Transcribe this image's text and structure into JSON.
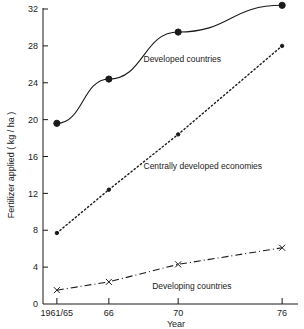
{
  "chart_data": {
    "type": "line",
    "title": "",
    "xlabel": "Year",
    "ylabel": "Fertilizer applied ( kg / ha )",
    "categories": [
      "1961/65",
      "66",
      "70",
      "76"
    ],
    "x": [
      1963,
      1966,
      1970,
      1976
    ],
    "xlim": [
      1962.2,
      1976.8
    ],
    "ylim": [
      0,
      32
    ],
    "yticks": [
      0,
      4,
      8,
      12,
      16,
      20,
      24,
      28,
      32
    ],
    "ytick_labels": [
      "0",
      "4",
      "8",
      "12",
      "16",
      "20",
      "24",
      "28",
      "32"
    ],
    "xtick_labels": [
      "1961/65",
      "66",
      "70",
      "76"
    ],
    "grid": false,
    "legend_position": "inline-annotations",
    "series": [
      {
        "name": "Developed countries",
        "values": [
          19.6,
          24.4,
          29.5,
          32.4
        ],
        "line_style": "solid",
        "marker": "filled-circle",
        "color": "#1a1a1a",
        "label_x": 1968.0,
        "label_y": 26.2
      },
      {
        "name": "Centrally developed economies",
        "values": [
          7.7,
          12.4,
          18.4,
          28.0
        ],
        "line_style": "dotted",
        "marker": "small-dot",
        "color": "#1a1a1a",
        "label_x": 1968.0,
        "label_y": 14.6
      },
      {
        "name": "Developing countries",
        "values": [
          1.5,
          2.4,
          4.3,
          6.1
        ],
        "line_style": "dash-dot",
        "marker": "cross",
        "color": "#1a1a1a",
        "label_x": 1968.5,
        "label_y": 1.6
      }
    ]
  },
  "axes": {
    "y_axis_title": "Fertilizer applied ( kg / ha )",
    "x_axis_title": "Year"
  }
}
